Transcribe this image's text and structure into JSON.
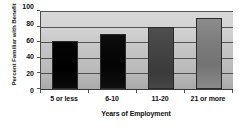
{
  "chart_data": {
    "type": "bar",
    "title": "",
    "categories": [
      "5 or less",
      "6-10",
      "11-20",
      "21 or more"
    ],
    "values": [
      61,
      71,
      79,
      91
    ],
    "xlabel": "Years of Employment",
    "ylabel": "Percent Familiar with Benefit",
    "ylim": [
      0,
      100
    ],
    "yticks": [
      0,
      20,
      40,
      60,
      80,
      100
    ],
    "ytick_labels": [
      "0",
      "20",
      "40",
      "60",
      "80",
      "100"
    ],
    "grid": true,
    "legend": false,
    "series": [
      {
        "name": "Percent Familiar with Benefit",
        "values": [
          61,
          71,
          79,
          91
        ],
        "bar_colors": [
          "#000000",
          "#050505",
          "#434343",
          "#7e7e7e"
        ]
      }
    ],
    "plot_background": "#c6c6c6",
    "axis_color": "#3d3d3d"
  }
}
